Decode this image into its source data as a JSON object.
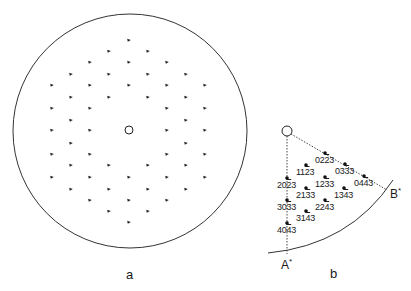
{
  "panels": {
    "a": {
      "label": "a",
      "outer_circle": {
        "cx": 130,
        "cy": 131,
        "r": 117
      },
      "center_marker": {
        "cx": 129,
        "cy": 130,
        "r": 4
      },
      "spots": [
        [
          129,
          40
        ],
        [
          109,
          51
        ],
        [
          148,
          51
        ],
        [
          90,
          62
        ],
        [
          129,
          62
        ],
        [
          167,
          62
        ],
        [
          71,
          74
        ],
        [
          109,
          74
        ],
        [
          148,
          74
        ],
        [
          186,
          74
        ],
        [
          52,
          85
        ],
        [
          90,
          85
        ],
        [
          129,
          85
        ],
        [
          167,
          85
        ],
        [
          205,
          85
        ],
        [
          71,
          97
        ],
        [
          109,
          97
        ],
        [
          148,
          97
        ],
        [
          186,
          97
        ],
        [
          52,
          108
        ],
        [
          90,
          108
        ],
        [
          167,
          108
        ],
        [
          205,
          108
        ],
        [
          71,
          120
        ],
        [
          186,
          120
        ],
        [
          52,
          130
        ],
        [
          90,
          130
        ],
        [
          167,
          130
        ],
        [
          205,
          130
        ],
        [
          71,
          143
        ],
        [
          186,
          143
        ],
        [
          52,
          154
        ],
        [
          90,
          154
        ],
        [
          167,
          154
        ],
        [
          205,
          154
        ],
        [
          71,
          165
        ],
        [
          109,
          165
        ],
        [
          148,
          165
        ],
        [
          186,
          165
        ],
        [
          52,
          177
        ],
        [
          90,
          177
        ],
        [
          129,
          177
        ],
        [
          167,
          177
        ],
        [
          205,
          177
        ],
        [
          71,
          189
        ],
        [
          109,
          189
        ],
        [
          148,
          189
        ],
        [
          186,
          189
        ],
        [
          90,
          200
        ],
        [
          129,
          200
        ],
        [
          167,
          200
        ],
        [
          109,
          211
        ],
        [
          148,
          211
        ],
        [
          129,
          222
        ]
      ]
    },
    "b": {
      "label": "b",
      "origin": {
        "cx": 287,
        "cy": 131,
        "r": 5
      },
      "axis_a": {
        "label": "A",
        "sup": "*"
      },
      "axis_b": {
        "label": "B",
        "sup": "*"
      },
      "reflections": [
        {
          "pre": "02",
          "bar": "2",
          "post": "3",
          "x": 325,
          "y": 153
        },
        {
          "pre": "03",
          "bar": "3",
          "post": "3",
          "x": 345,
          "y": 164
        },
        {
          "pre": "04",
          "bar": "4",
          "post": "3",
          "x": 364,
          "y": 176
        },
        {
          "pre": "11",
          "bar": "2",
          "post": "3",
          "x": 306,
          "y": 165
        },
        {
          "pre": "12",
          "bar": "3",
          "post": "3",
          "x": 325,
          "y": 177
        },
        {
          "pre": "13",
          "bar": "4",
          "post": "3",
          "x": 344,
          "y": 188
        },
        {
          "pre": "20",
          "bar": "2",
          "post": "3",
          "x": 287,
          "y": 178
        },
        {
          "pre": "21",
          "bar": "3",
          "post": "3",
          "x": 306,
          "y": 188
        },
        {
          "pre": "22",
          "bar": "4",
          "post": "3",
          "x": 325,
          "y": 200
        },
        {
          "pre": "30",
          "bar": "3",
          "post": "3",
          "x": 287,
          "y": 200
        },
        {
          "pre": "31",
          "bar": "4",
          "post": "3",
          "x": 306,
          "y": 211
        },
        {
          "pre": "40",
          "bar": "4",
          "post": "3",
          "x": 287,
          "y": 223
        }
      ]
    }
  }
}
